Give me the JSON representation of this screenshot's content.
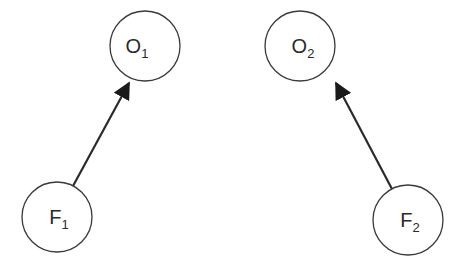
{
  "diagram": {
    "nodes": [
      {
        "id": "O1",
        "letter": "O",
        "sub": "1",
        "cx": 145,
        "cy": 46,
        "r": 35
      },
      {
        "id": "O2",
        "letter": "O",
        "sub": "2",
        "cx": 300,
        "cy": 46,
        "r": 35
      },
      {
        "id": "F1",
        "letter": "F",
        "sub": "1",
        "cx": 57,
        "cy": 217,
        "r": 35
      },
      {
        "id": "F2",
        "letter": "F",
        "sub": "2",
        "cx": 408,
        "cy": 220,
        "r": 35
      }
    ],
    "edges": [
      {
        "from": "F1",
        "to": "O1"
      },
      {
        "from": "F2",
        "to": "O2"
      }
    ],
    "colors": {
      "stroke": "#2a2a2a",
      "background": "#ffffff"
    }
  }
}
